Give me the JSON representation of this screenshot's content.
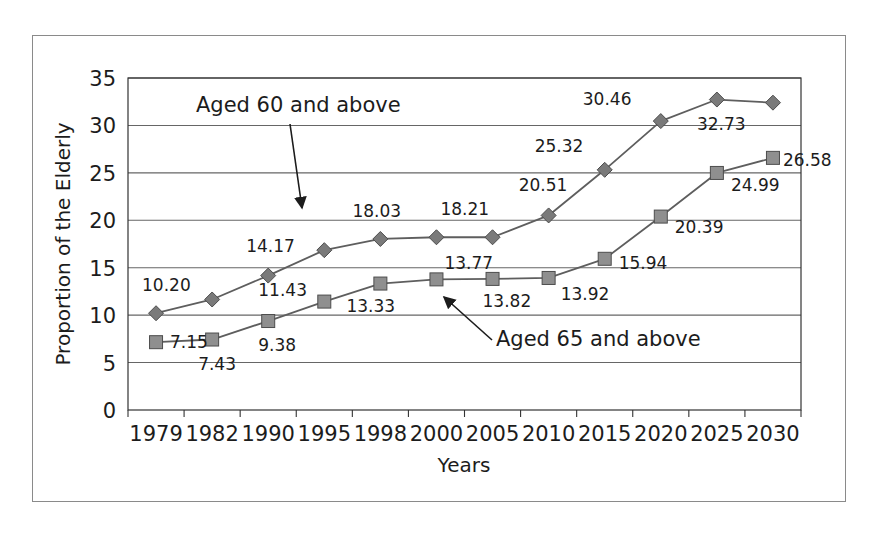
{
  "chart_data": {
    "type": "line",
    "title": "",
    "xlabel": "Years",
    "ylabel": "Proportion of the Elderly",
    "categories": [
      "1979",
      "1982",
      "1990",
      "1995",
      "1998",
      "2000",
      "2005",
      "2010",
      "2015",
      "2020",
      "2025",
      "2030"
    ],
    "ylim": [
      0,
      35
    ],
    "ytick_values": [
      0,
      5,
      10,
      15,
      20,
      25,
      30,
      35
    ],
    "ytick_labels": [
      "0",
      "5",
      "10",
      "15",
      "20",
      "25",
      "30",
      "35"
    ],
    "grid": "horizontal",
    "legend_position": "inline-annotations",
    "series": [
      {
        "name": "Aged 60 and above",
        "marker": "diamond",
        "color": "#7a7a7a",
        "line_color": "#5e5e5e",
        "values": [
          10.2,
          11.65,
          14.17,
          16.85,
          18.03,
          18.21,
          18.21,
          20.51,
          25.32,
          30.46,
          32.73,
          32.4
        ],
        "point_labels": [
          {
            "index": 0,
            "text": "10.20",
            "dx": -14,
            "dy": -22
          },
          {
            "index": 1,
            "text": "",
            "dx": 0,
            "dy": 0
          },
          {
            "index": 2,
            "text": "14.17",
            "dx": -22,
            "dy": -24
          },
          {
            "index": 3,
            "text": "",
            "dx": 0,
            "dy": 0
          },
          {
            "index": 4,
            "text": "18.03",
            "dx": -28,
            "dy": -22
          },
          {
            "index": 5,
            "text": "18.21",
            "dx": 4,
            "dy": -22
          },
          {
            "index": 6,
            "text": "",
            "dx": 0,
            "dy": 0
          },
          {
            "index": 7,
            "text": "20.51",
            "dx": -30,
            "dy": -24
          },
          {
            "index": 8,
            "text": "25.32",
            "dx": -70,
            "dy": -18
          },
          {
            "index": 9,
            "text": "30.46",
            "dx": -78,
            "dy": -16
          },
          {
            "index": 10,
            "text": "32.73",
            "dx": -20,
            "dy": 30
          },
          {
            "index": 11,
            "text": "",
            "dx": 0,
            "dy": 0
          }
        ]
      },
      {
        "name": "Aged 65 and above",
        "marker": "square",
        "color": "#8f8f8f",
        "line_color": "#5e5e5e",
        "values": [
          7.15,
          7.43,
          9.38,
          11.43,
          13.33,
          13.77,
          13.82,
          13.92,
          15.94,
          20.39,
          24.99,
          26.58
        ],
        "point_labels": [
          {
            "index": 0,
            "text": "7.15",
            "dx": 14,
            "dy": 6
          },
          {
            "index": 1,
            "text": "7.43",
            "dx": -14,
            "dy": 30
          },
          {
            "index": 2,
            "text": "9.38",
            "dx": -10,
            "dy": 30
          },
          {
            "index": 3,
            "text": "11.43",
            "dx": -66,
            "dy": -6
          },
          {
            "index": 4,
            "text": "13.33",
            "dx": -34,
            "dy": 28
          },
          {
            "index": 5,
            "text": "13.77",
            "dx": 8,
            "dy": -10
          },
          {
            "index": 6,
            "text": "13.82",
            "dx": -10,
            "dy": 28
          },
          {
            "index": 7,
            "text": "13.92",
            "dx": 12,
            "dy": 22
          },
          {
            "index": 8,
            "text": "15.94",
            "dx": 14,
            "dy": 10
          },
          {
            "index": 9,
            "text": "20.39",
            "dx": 14,
            "dy": 16
          },
          {
            "index": 10,
            "text": "24.99",
            "dx": 14,
            "dy": 18
          },
          {
            "index": 11,
            "text": "26.58",
            "dx": 10,
            "dy": 8
          }
        ]
      }
    ],
    "annotations": [
      {
        "id": "annotation-aged-60",
        "text": "Aged 60 and above",
        "text_x": 196,
        "text_y": 112,
        "arrow_x1": 290,
        "arrow_y1": 124,
        "arrow_x2": 302,
        "arrow_y2": 208
      },
      {
        "id": "annotation-aged-65",
        "text": "Aged 65 and above",
        "text_x": 496,
        "text_y": 346,
        "arrow_x1": 492,
        "arrow_y1": 340,
        "arrow_x2": 444,
        "arrow_y2": 297
      }
    ]
  },
  "colors": {
    "frame_border": "#8a8a8a",
    "axis_line": "#333333",
    "gridline": "#666666",
    "text": "#1c1c1c",
    "series_diamond": "#7a7a7a",
    "series_square": "#8f8f8f"
  }
}
